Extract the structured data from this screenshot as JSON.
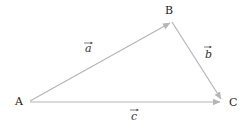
{
  "diagram": {
    "type": "vector-triangle",
    "colors": {
      "edge": "#b5b5b5",
      "label": "#222222",
      "background": "#ffffff"
    },
    "points": [
      {
        "id": "A",
        "label": "A",
        "x": 30,
        "y": 101
      },
      {
        "id": "B",
        "label": "B",
        "x": 172,
        "y": 22
      },
      {
        "id": "C",
        "label": "C",
        "x": 222,
        "y": 101
      }
    ],
    "vectors": [
      {
        "id": "a",
        "label": "a",
        "from": "A",
        "to": "B"
      },
      {
        "id": "b",
        "label": "b",
        "from": "B",
        "to": "C"
      },
      {
        "id": "c",
        "label": "c",
        "from": "A",
        "to": "C"
      }
    ]
  }
}
